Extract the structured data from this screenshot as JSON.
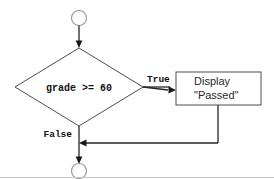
{
  "diagram": {
    "type": "flowchart",
    "nodes": {
      "start_connector": {
        "shape": "circle",
        "name": "start-connector",
        "label": ""
      },
      "decision": {
        "shape": "diamond",
        "name": "decision-node",
        "label": "grade >= 60"
      },
      "process": {
        "shape": "rectangle",
        "name": "process-node",
        "line1": "Display",
        "line2": "\"Passed\""
      },
      "end_connector": {
        "shape": "circle",
        "name": "end-connector",
        "label": ""
      }
    },
    "edges": [
      {
        "name": "edge-start-to-decision",
        "from": "start_connector",
        "to": "decision",
        "label": ""
      },
      {
        "name": "edge-decision-true",
        "from": "decision",
        "to": "process",
        "label": "True"
      },
      {
        "name": "edge-decision-false",
        "from": "decision",
        "to": "end_connector",
        "label": "False"
      },
      {
        "name": "edge-process-to-merge",
        "from": "process",
        "to": "end_connector",
        "label": ""
      }
    ],
    "colors": {
      "shape_stroke": "#4d4d4d",
      "line": "#262626",
      "connector_stroke": "#9a9a9a",
      "text": "#111111",
      "process_text": "#2b2b2b",
      "background": "#ffffff",
      "rule": "#c8c8c8"
    }
  }
}
